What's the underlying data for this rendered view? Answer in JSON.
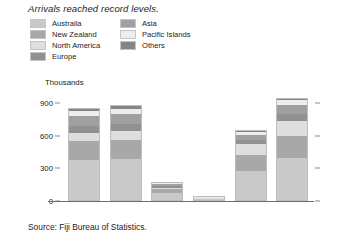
{
  "title": "Arrivals reached record levels.",
  "source": "Source: Fiji Bureau of Statistics.",
  "axis_unit": "Thousands",
  "legend": {
    "column_1": [
      {
        "label": "Australia",
        "color": "#c9c9c9"
      },
      {
        "label": "New Zealand",
        "color": "#a8a8a8"
      },
      {
        "label": "North America",
        "color": "#dedede"
      },
      {
        "label": "Europe",
        "color": "#919191"
      }
    ],
    "column_2": [
      {
        "label": "Asia",
        "color": "#a0a0a0"
      },
      {
        "label": "Pacific Islands",
        "color": "#ededed"
      },
      {
        "label": "Others",
        "color": "#858585"
      }
    ]
  },
  "chart_data": {
    "type": "bar",
    "subtype": "stacked",
    "title": "Arrivals reached record levels.",
    "xlabel": "",
    "ylabel": "Thousands",
    "ylim": [
      0,
      900
    ],
    "yticks": [
      0,
      300,
      600,
      900
    ],
    "ytick_labels": [
      "0",
      "300",
      "600",
      "900"
    ],
    "grid": false,
    "legend_position": "top",
    "categories": [
      "2018",
      "2019",
      "2020",
      "2021",
      "2022",
      "2023"
    ],
    "series": [
      {
        "name": "Australia",
        "color": "#c9c9c9",
        "values": [
          365,
          375,
          62,
          8,
          268,
          385
        ]
      },
      {
        "name": "New Zealand",
        "color": "#a8a8a8",
        "values": [
          175,
          180,
          38,
          6,
          148,
          205
        ]
      },
      {
        "name": "North America",
        "color": "#dedede",
        "values": [
          75,
          78,
          14,
          3,
          95,
          135
        ]
      },
      {
        "name": "Europe",
        "color": "#919191",
        "values": [
          62,
          64,
          12,
          2,
          40,
          62
        ]
      },
      {
        "name": "Asia",
        "color": "#a0a0a0",
        "values": [
          95,
          96,
          18,
          4,
          48,
          88
        ]
      },
      {
        "name": "Pacific Islands",
        "color": "#ededed",
        "values": [
          48,
          46,
          9,
          4,
          22,
          40
        ]
      },
      {
        "name": "Others",
        "color": "#858585",
        "values": [
          20,
          21,
          4,
          3,
          9,
          15
        ]
      }
    ],
    "totals": [
      840,
      860,
      157,
      30,
      630,
      930
    ],
    "units": "thousands of visitor arrivals"
  }
}
